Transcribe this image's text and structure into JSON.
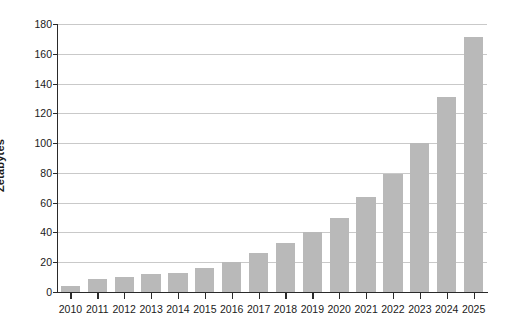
{
  "chart_data": {
    "type": "bar",
    "title": "",
    "subtitle": "",
    "xlabel": "",
    "ylabel": "Zetabytes",
    "categories": [
      "2010",
      "2011",
      "2012",
      "2013",
      "2014",
      "2015",
      "2016",
      "2017",
      "2018",
      "2019",
      "2020",
      "2021",
      "2022",
      "2023",
      "2024",
      "2025"
    ],
    "values": [
      4,
      9,
      10,
      12,
      13,
      16,
      20,
      26,
      33,
      40,
      50,
      64,
      79,
      100,
      131,
      171
    ],
    "series": [
      {
        "name": "Global data volume",
        "values": [
          4,
          9,
          10,
          12,
          13,
          16,
          20,
          26,
          33,
          40,
          50,
          64,
          79,
          100,
          131,
          171
        ]
      }
    ],
    "ylim": [
      0,
      180
    ],
    "yticks": [
      0,
      20,
      40,
      60,
      80,
      100,
      120,
      140,
      160,
      180
    ],
    "ytick_labels": [
      "0",
      "20",
      "40",
      "60",
      "80",
      "100",
      "120",
      "140",
      "160",
      "180"
    ],
    "xlim_categories": 16,
    "grid": "horizontal",
    "legend": "none",
    "bar_color": "#b9b9b9",
    "gridline_color": "#c9c9c9",
    "axis_color": "#2a2a2a",
    "background_color": "#ffffff",
    "annotations": []
  }
}
